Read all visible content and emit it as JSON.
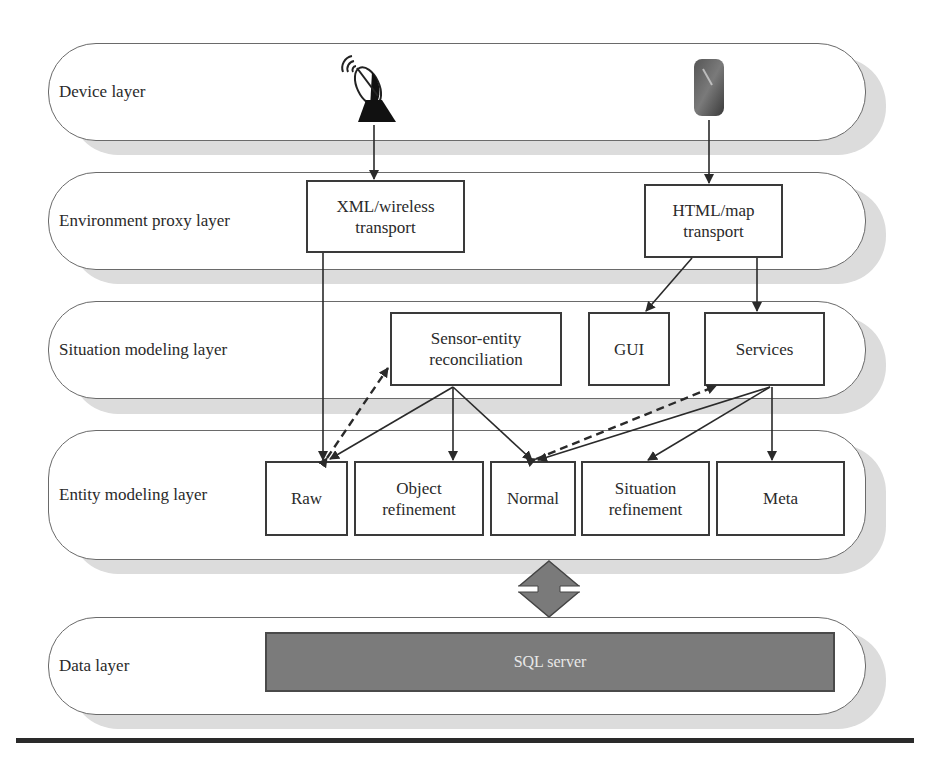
{
  "diagram": {
    "layers": [
      {
        "id": "device",
        "label": "Device layer"
      },
      {
        "id": "environment-proxy",
        "label": "Environment proxy layer"
      },
      {
        "id": "situation-modeling",
        "label": "Situation modeling layer"
      },
      {
        "id": "entity-modeling",
        "label": "Entity modeling layer"
      },
      {
        "id": "data",
        "label": "Data layer"
      }
    ],
    "devices": [
      {
        "id": "satellite-dish",
        "icon": "satellite-dish-icon"
      },
      {
        "id": "mobile-phone",
        "icon": "mobile-phone-icon"
      }
    ],
    "boxes": {
      "xml_transport": {
        "line1": "XML/wireless",
        "line2": "transport"
      },
      "html_transport": {
        "line1": "HTML/map",
        "line2": "transport"
      },
      "sensor_entity": {
        "line1": "Sensor-entity",
        "line2": "reconciliation"
      },
      "gui": {
        "line1": "GUI"
      },
      "services": {
        "line1": "Services"
      },
      "raw": {
        "line1": "Raw"
      },
      "object_refinement": {
        "line1": "Object",
        "line2": "refinement"
      },
      "normal": {
        "line1": "Normal"
      },
      "situation_refinement": {
        "line1": "Situation",
        "line2": "refinement"
      },
      "meta": {
        "line1": "Meta"
      },
      "sql_server": {
        "line1": "SQL server"
      }
    },
    "connections": [
      {
        "from": "satellite-dish",
        "to": "xml_transport",
        "style": "solid"
      },
      {
        "from": "mobile-phone",
        "to": "html_transport",
        "style": "solid"
      },
      {
        "from": "xml_transport",
        "to": "raw",
        "style": "solid"
      },
      {
        "from": "html_transport",
        "to": "gui",
        "style": "solid"
      },
      {
        "from": "html_transport",
        "to": "services",
        "style": "solid"
      },
      {
        "from": "raw",
        "to": "sensor_entity",
        "style": "dashed",
        "bidirectional": true
      },
      {
        "from": "sensor_entity",
        "to": "raw",
        "style": "solid"
      },
      {
        "from": "sensor_entity",
        "to": "object_refinement",
        "style": "solid"
      },
      {
        "from": "sensor_entity",
        "to": "normal",
        "style": "solid"
      },
      {
        "from": "normal",
        "to": "services",
        "style": "dashed",
        "bidirectional": true
      },
      {
        "from": "services",
        "to": "normal",
        "style": "solid"
      },
      {
        "from": "services",
        "to": "situation_refinement",
        "style": "solid"
      },
      {
        "from": "services",
        "to": "meta",
        "style": "solid"
      },
      {
        "from": "entity-modeling",
        "to": "data",
        "style": "double-arrow"
      }
    ],
    "colors": {
      "layer_border": "#6a6a6a",
      "layer_shadow": "#dcdcdc",
      "box_border": "#3a3a3a",
      "sql_fill": "#7b7b7b",
      "double_arrow_fill": "#7a7a7a",
      "text": "#2a2a2a"
    }
  }
}
